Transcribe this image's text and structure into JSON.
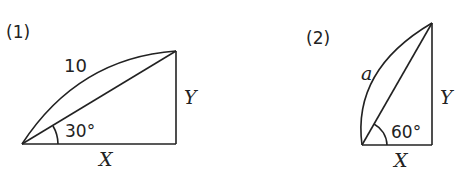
{
  "figures": [
    {
      "label": "(1)",
      "arc_label": "10",
      "angle_label": "30°",
      "side_x": "X",
      "side_y": "Y"
    },
    {
      "label": "(2)",
      "arc_label": "a",
      "angle_label": "60°",
      "side_x": "X",
      "side_y": "Y"
    }
  ],
  "colors": {
    "ink": "#222222",
    "background": "#ffffff"
  }
}
